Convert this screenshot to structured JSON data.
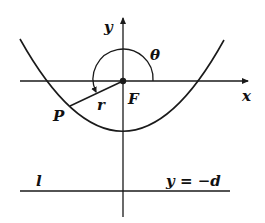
{
  "diagram": {
    "type": "conic-polar-coordinates",
    "labels": {
      "y_axis": "y",
      "x_axis": "x",
      "theta": "θ",
      "focus": "F",
      "radius": "r",
      "point": "P",
      "directrix_name": "l",
      "directrix_eq": "y = −d"
    },
    "colors": {
      "stroke": "#1a1a1a",
      "background": "#ffffff"
    }
  }
}
